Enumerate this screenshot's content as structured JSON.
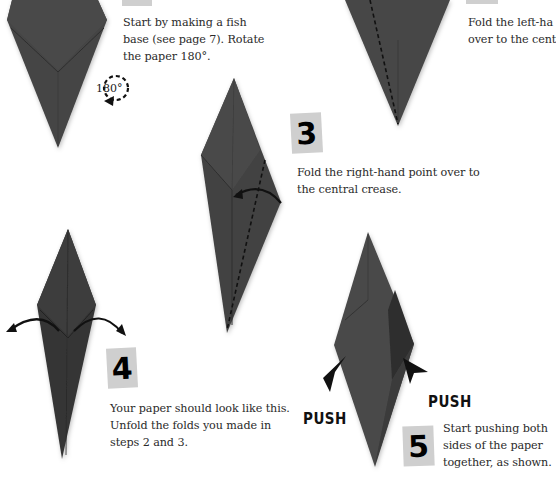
{
  "page": {
    "background": "#ffffff",
    "paper_color": "#3f3f3f",
    "badge_color": "#cfcfcf"
  },
  "steps": [
    {
      "number": "1",
      "text_lines": [
        "Start by making a fish",
        "base (see page 7). Rotate",
        "the paper 180°."
      ],
      "rotation_label": "180°"
    },
    {
      "number": "2",
      "text_lines": [
        "Fold the left-ha",
        "over to the cent"
      ]
    },
    {
      "number": "3",
      "text_lines": [
        "Fold the right-hand point over to",
        "the central crease."
      ]
    },
    {
      "number": "4",
      "text_lines": [
        "Your paper should look like this.",
        "Unfold the folds you made in",
        "steps 2 and 3."
      ]
    },
    {
      "number": "5",
      "text_lines": [
        "Start pushing both",
        "sides of the paper",
        "together, as shown."
      ],
      "push_labels": [
        "PUSH",
        "PUSH"
      ]
    }
  ]
}
